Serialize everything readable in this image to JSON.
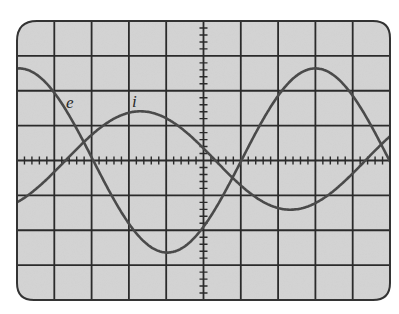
{
  "chart_data": {
    "type": "line",
    "title": "",
    "xlabel": "",
    "ylabel": "",
    "grid": true,
    "grid_divisions": {
      "x": 10,
      "y": 8
    },
    "minor_ticks_per_division": 5,
    "xlim": [
      -5,
      5
    ],
    "ylim": [
      -4,
      4
    ],
    "x_units": "divisions",
    "y_units": "divisions",
    "series": [
      {
        "name": "e",
        "label": "e",
        "shape": "sinusoid",
        "amplitude": 2.64,
        "period": 7.94,
        "peak_x": 3.0,
        "x": [
          -5,
          -4,
          -3,
          -2,
          -1,
          0,
          1,
          2,
          3,
          4,
          5
        ],
        "values": [
          2.5,
          1.8,
          0.4,
          -1.1,
          -2.3,
          -2.6,
          -2.0,
          -0.7,
          2.64,
          2.3,
          0.0
        ]
      },
      {
        "name": "i",
        "label": "i",
        "shape": "sinusoid",
        "amplitude": 1.41,
        "period": 8.04,
        "peak_x": -1.69,
        "x": [
          -5,
          -4,
          -3,
          -2,
          -1,
          0,
          1,
          2,
          3,
          4,
          5
        ],
        "values": [
          -1.35,
          -0.7,
          0.5,
          1.35,
          1.2,
          0.4,
          -0.6,
          -1.3,
          -1.35,
          -0.8,
          0.8
        ]
      }
    ],
    "annotations": [
      {
        "text": "e",
        "x": -3.6,
        "y": 1.6
      },
      {
        "text": "i",
        "x": -1.8,
        "y": 1.75
      }
    ]
  },
  "labels": {
    "e": "e",
    "i": "i"
  },
  "colors": {
    "screen_bg": "#d4d4d4",
    "grid": "#2b2b2b",
    "trace": "#4a4a4a",
    "border": "#333333"
  }
}
